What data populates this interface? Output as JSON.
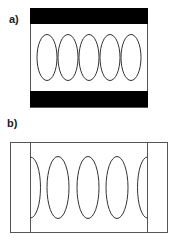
{
  "panels": [
    {
      "label": "a)",
      "description": "Five vertical ellipses between two black horizontal bars",
      "ellipse_count": 5
    },
    {
      "label": "b)",
      "description": "Three full ellipses and two half ellipses between vertical boundary lines",
      "ellipse_count": 3,
      "half_ellipse_count": 2
    }
  ],
  "colors": {
    "bar": "#000000",
    "stroke": "#333333",
    "background": "#ffffff"
  }
}
